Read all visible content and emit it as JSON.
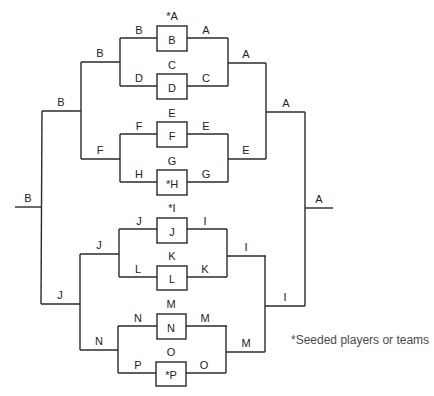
{
  "diagram": {
    "type": "single-elimination-tournament-bracket",
    "footnote": "*Seeded players or teams",
    "colors": {
      "line": "#2a2a2a",
      "text": "#222222",
      "footnote": "#4a4a4a"
    },
    "matches": [
      {
        "id": "m1",
        "top": "*A",
        "bottom": "B",
        "left_label": "B",
        "right_label": "A"
      },
      {
        "id": "m2",
        "top": "C",
        "bottom": "D",
        "left_label": "D",
        "right_label": "C"
      },
      {
        "id": "m3",
        "top": "E",
        "bottom": "F",
        "left_label": "F",
        "right_label": "E"
      },
      {
        "id": "m4",
        "top": "G",
        "bottom": "*H",
        "left_label": "H",
        "right_label": "G"
      },
      {
        "id": "m5",
        "top": "*I",
        "bottom": "J",
        "left_label": "J",
        "right_label": "I"
      },
      {
        "id": "m6",
        "top": "K",
        "bottom": "L",
        "left_label": "L",
        "right_label": "K"
      },
      {
        "id": "m7",
        "top": "M",
        "bottom": "N",
        "left_label": "N",
        "right_label": "M"
      },
      {
        "id": "m8",
        "top": "O",
        "bottom": "*P",
        "left_label": "P",
        "right_label": "O"
      }
    ],
    "left_bracket": {
      "round2": [
        "B",
        "F",
        "J",
        "N"
      ],
      "round3": [
        "B",
        "J"
      ],
      "final": "B"
    },
    "right_bracket": {
      "round2": [
        "A",
        "E",
        "I",
        "M"
      ],
      "round3": [
        "A",
        "I"
      ],
      "final": "A"
    }
  }
}
